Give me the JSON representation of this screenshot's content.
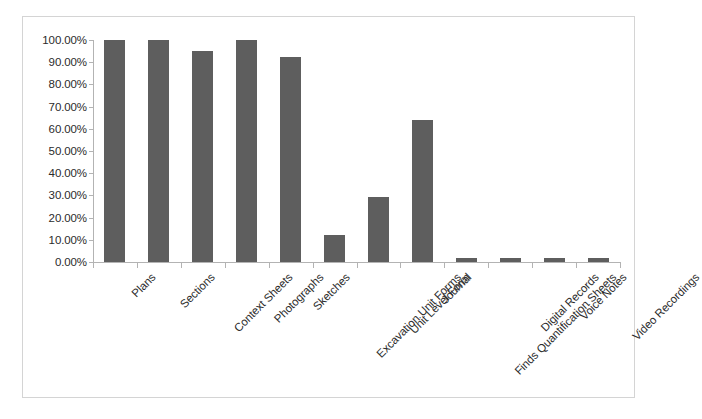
{
  "chart_data": {
    "type": "bar",
    "title": "",
    "subtitle": "",
    "xlabel": "",
    "ylabel": "",
    "ylim": [
      0,
      100
    ],
    "ytick_labels": [
      "0.00%",
      "10.00%",
      "20.00%",
      "30.00%",
      "40.00%",
      "50.00%",
      "60.00%",
      "70.00%",
      "80.00%",
      "90.00%",
      "100.00%"
    ],
    "ytick_values": [
      0,
      10,
      20,
      30,
      40,
      50,
      60,
      70,
      80,
      90,
      100
    ],
    "grid": false,
    "legend": null,
    "bar_color": "#5e5e5e",
    "axis_color": "#b3b3b3",
    "frame_color": "#d4d4d4",
    "categories": [
      "Plans",
      "Sections",
      "Context Sheets",
      "Photographs",
      "Sketches",
      "Excavation Unit Forms",
      "Unit Level Form",
      "Journal",
      "Finds Quantification Sheets",
      "Digital Records",
      "Voice Notes",
      "Video Recordings"
    ],
    "values": [
      100,
      100,
      95,
      100,
      92.5,
      12,
      29.5,
      64,
      2,
      2,
      2,
      2
    ]
  }
}
